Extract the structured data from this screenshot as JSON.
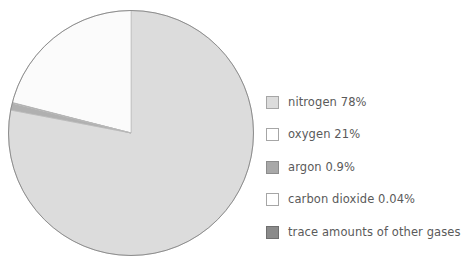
{
  "chart_data": {
    "type": "pie",
    "title": "",
    "subtitle": "",
    "xlabel": "",
    "ylabel": "",
    "grid": false,
    "legend_position": "right",
    "start_angle_deg": 0,
    "direction": "clockwise",
    "categories": [
      "nitrogen",
      "oxygen",
      "argon",
      "carbon dioxide",
      "trace amounts of other gases"
    ],
    "values": [
      78,
      21,
      0.9,
      0.04,
      0.06
    ],
    "value_labels": [
      "78%",
      "21%",
      "0.9%",
      "0.04%",
      ""
    ],
    "slices": [
      {
        "name": "nitrogen",
        "label": "nitrogen 78%",
        "value": 78,
        "value_text": "78%",
        "color": "#dcdcdc",
        "swatch_color": "#dcdcdc",
        "swatch_border": "#a6a6a6"
      },
      {
        "name": "oxygen",
        "label": "oxygen 21%",
        "value": 21,
        "value_text": "21%",
        "color": "#fbfbfb",
        "swatch_color": "#ffffff",
        "swatch_border": "#a6a6a6"
      },
      {
        "name": "argon",
        "label": "argon 0.9%",
        "value": 0.9,
        "value_text": "0.9%",
        "color": "#b0b0b0",
        "swatch_color": "#a8a8a8",
        "swatch_border": "#8c8c8c"
      },
      {
        "name": "carbon dioxide",
        "label": "carbon dioxide 0.04%",
        "value": 0.04,
        "value_text": "0.04%",
        "color": "#ffffff",
        "swatch_color": "#ffffff",
        "swatch_border": "#a6a6a6"
      },
      {
        "name": "trace amounts of other gases",
        "label": "trace amounts of other gases",
        "value": 0.06,
        "value_text": "",
        "color": "#8e8e8e",
        "swatch_color": "#8a8a8a",
        "swatch_border": "#6f6f6f"
      }
    ],
    "outline_color": "#8e8e8e",
    "background": "#ffffff"
  },
  "legend": {
    "items": [
      {
        "label": "nitrogen 78%"
      },
      {
        "label": "oxygen 21%"
      },
      {
        "label": "argon 0.9%"
      },
      {
        "label": "carbon dioxide 0.04%"
      },
      {
        "label": "trace amounts of other gases"
      }
    ]
  }
}
